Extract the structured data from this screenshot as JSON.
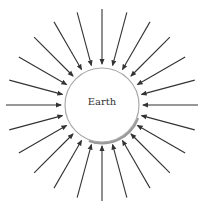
{
  "diagram": {
    "center_label": "Earth",
    "center": [
      102,
      105
    ],
    "radius": 37,
    "arrow_count": 24,
    "arrow_outer_radius": 96,
    "arrow_inner_radius": 41,
    "colors": {
      "arrow": "#333333",
      "circle_stroke": "#aaaaaa",
      "shadow": "#999999",
      "background": "#ffffff"
    }
  }
}
